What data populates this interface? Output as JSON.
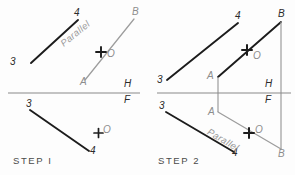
{
  "drawing": {
    "title_step1": "STEP  I",
    "title_step2": "STEP  2",
    "fold_line": {
      "h_label": "H",
      "f_label": "F"
    },
    "colors": {
      "dark_line": "#1c1c1c",
      "light_line": "#9d9d9d",
      "fold_line": "#8a8a8a",
      "label_dark": "#2b2b2b",
      "label_gray": "#8d8d8d",
      "background": "#fdfdfd"
    },
    "parallel_note": "Parallel"
  },
  "step1": {
    "top_view": {
      "line34": {
        "p3": "3",
        "p4": "4"
      },
      "lineAB": {
        "pA": "A",
        "pB": "B"
      },
      "point_o": "O",
      "note": "Parallel"
    },
    "front_view": {
      "line34": {
        "p3": "3",
        "p4": "4"
      },
      "point_o": "O"
    }
  },
  "step2": {
    "top_view": {
      "line34": {
        "p3": "3",
        "p4": "4"
      },
      "lineAB": {
        "pA": "A",
        "pB": "B"
      },
      "point_o": "O"
    },
    "front_view": {
      "line34": {
        "p3": "3",
        "p4": "4"
      },
      "lineAB": {
        "pA": "A",
        "pB": "B"
      },
      "point_o": "O",
      "note": "Parallel"
    }
  }
}
